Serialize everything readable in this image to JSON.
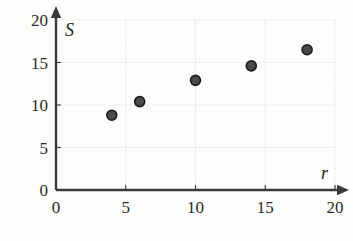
{
  "chart_data": {
    "type": "scatter",
    "title": "",
    "subtitle": "",
    "xlabel": "r",
    "ylabel": "S",
    "xlim": [
      0,
      20
    ],
    "ylim": [
      0,
      20
    ],
    "grid": true,
    "legend": null,
    "x_ticks": [
      "0",
      "5",
      "10",
      "15",
      "20"
    ],
    "x_tick_values": [
      0,
      5,
      10,
      15,
      20
    ],
    "y_ticks": [
      "0",
      "5",
      "10",
      "15",
      "20"
    ],
    "y_tick_values": [
      0,
      5,
      10,
      15,
      20
    ],
    "series": [
      {
        "name": "S vs r",
        "marker": "circle",
        "marker_color": "#4a4a4a",
        "marker_edge_color": "#1a1a1a",
        "points": [
          {
            "x": 4,
            "y": 8.8
          },
          {
            "x": 6,
            "y": 10.4
          },
          {
            "x": 10,
            "y": 12.9
          },
          {
            "x": 14,
            "y": 14.6
          },
          {
            "x": 18,
            "y": 16.5
          }
        ]
      }
    ],
    "x": [
      4,
      6,
      10,
      14,
      18
    ],
    "values": [
      8.8,
      10.4,
      12.9,
      14.6,
      16.5
    ],
    "annotations": []
  },
  "style": {
    "background_color": "#fdfdfc",
    "axis_color": "#3a3a3a",
    "grid_color": "#cfcfcf",
    "tick_label_color": "#2b2b2b",
    "axis_label_color": "#1f1f1f"
  }
}
